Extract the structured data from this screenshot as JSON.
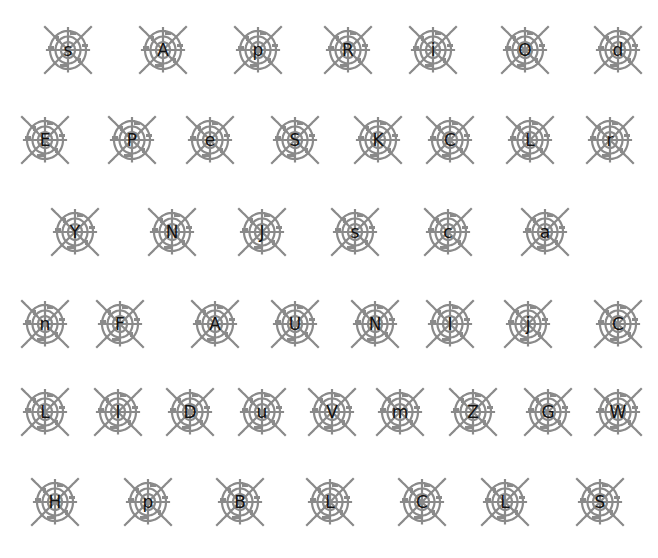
{
  "colors": {
    "background": "#ffffff",
    "web": "#8a8a8a",
    "letter": "#111111"
  },
  "icon": "spiderweb-icon",
  "rows": [
    {
      "y": 50,
      "tiles": [
        {
          "x": 68,
          "ch": "s"
        },
        {
          "x": 163,
          "ch": "A"
        },
        {
          "x": 258,
          "ch": "p"
        },
        {
          "x": 348,
          "ch": "R"
        },
        {
          "x": 433,
          "ch": "i"
        },
        {
          "x": 525,
          "ch": "O"
        },
        {
          "x": 618,
          "ch": "d"
        }
      ]
    },
    {
      "y": 140,
      "tiles": [
        {
          "x": 45,
          "ch": "E"
        },
        {
          "x": 132,
          "ch": "P"
        },
        {
          "x": 210,
          "ch": "e"
        },
        {
          "x": 295,
          "ch": "S"
        },
        {
          "x": 378,
          "ch": "K"
        },
        {
          "x": 450,
          "ch": "C"
        },
        {
          "x": 530,
          "ch": "L"
        },
        {
          "x": 610,
          "ch": "r"
        }
      ]
    },
    {
      "y": 232,
      "tiles": [
        {
          "x": 75,
          "ch": "Y"
        },
        {
          "x": 172,
          "ch": "N"
        },
        {
          "x": 262,
          "ch": "J"
        },
        {
          "x": 355,
          "ch": "s"
        },
        {
          "x": 448,
          "ch": "c"
        },
        {
          "x": 545,
          "ch": "a"
        }
      ]
    },
    {
      "y": 324,
      "tiles": [
        {
          "x": 45,
          "ch": "n"
        },
        {
          "x": 120,
          "ch": "F"
        },
        {
          "x": 215,
          "ch": "A"
        },
        {
          "x": 295,
          "ch": "U"
        },
        {
          "x": 375,
          "ch": "N"
        },
        {
          "x": 450,
          "ch": "I"
        },
        {
          "x": 528,
          "ch": "j"
        },
        {
          "x": 618,
          "ch": "C"
        }
      ]
    },
    {
      "y": 412,
      "tiles": [
        {
          "x": 45,
          "ch": "L"
        },
        {
          "x": 118,
          "ch": "I"
        },
        {
          "x": 190,
          "ch": "D"
        },
        {
          "x": 262,
          "ch": "u"
        },
        {
          "x": 332,
          "ch": "V"
        },
        {
          "x": 400,
          "ch": "m"
        },
        {
          "x": 473,
          "ch": "Z"
        },
        {
          "x": 548,
          "ch": "G"
        },
        {
          "x": 618,
          "ch": "W"
        }
      ]
    },
    {
      "y": 502,
      "tiles": [
        {
          "x": 55,
          "ch": "H"
        },
        {
          "x": 148,
          "ch": "p"
        },
        {
          "x": 240,
          "ch": "B"
        },
        {
          "x": 330,
          "ch": "L"
        },
        {
          "x": 422,
          "ch": "C"
        },
        {
          "x": 505,
          "ch": "L"
        },
        {
          "x": 600,
          "ch": "S"
        }
      ]
    }
  ]
}
